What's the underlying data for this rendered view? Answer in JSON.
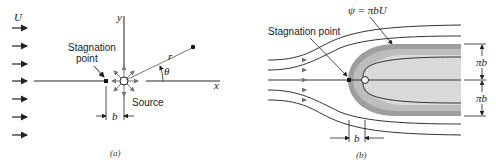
{
  "panel_a": {
    "caption": "(a)",
    "free_stream_label": "U",
    "y_axis_label": "y",
    "x_axis_label": "x",
    "stagnation_label_line1": "Stagnation",
    "stagnation_label_line2": "point",
    "source_label": "Source",
    "r_label": "r",
    "theta_label": "θ",
    "b_label": "b"
  },
  "panel_b": {
    "caption": "(b)",
    "psi_label": "ψ = πbU",
    "stagnation_label": "Stagnation point",
    "pi_b_upper": "πb",
    "pi_b_lower": "πb",
    "b_label": "b",
    "colors": {
      "outer_band": "#9e9e9e",
      "middle_band": "#bdbdbd",
      "inner_fill": "#d9d9d9"
    }
  }
}
